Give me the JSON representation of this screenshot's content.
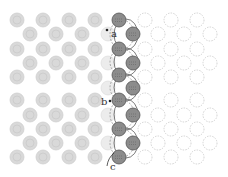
{
  "diagram": {
    "labels": {
      "a": "a",
      "b": "b",
      "c": "c"
    },
    "colors": {
      "left_atom_fill": "#d9d9d9",
      "left_atom_stroke": "#cfcfcf",
      "right_atom_stroke": "#c8c8c8",
      "chain_atom_fill": "#8c8c8c",
      "chain_atom_stroke": "#555555",
      "loop_stroke": "#444444"
    },
    "left_atoms": [
      [
        17,
        20
      ],
      [
        43,
        20
      ],
      [
        69,
        20
      ],
      [
        95,
        20
      ],
      [
        30,
        34
      ],
      [
        56,
        34
      ],
      [
        82,
        34
      ],
      [
        17,
        49
      ],
      [
        43,
        49
      ],
      [
        69,
        49
      ],
      [
        95,
        49
      ],
      [
        30,
        63
      ],
      [
        56,
        63
      ],
      [
        82,
        63
      ],
      [
        17,
        77
      ],
      [
        43,
        77
      ],
      [
        69,
        77
      ],
      [
        95,
        77
      ],
      [
        17,
        100
      ],
      [
        43,
        100
      ],
      [
        69,
        100
      ],
      [
        95,
        100
      ],
      [
        30,
        115
      ],
      [
        56,
        115
      ],
      [
        82,
        115
      ],
      [
        17,
        129
      ],
      [
        43,
        129
      ],
      [
        69,
        129
      ],
      [
        95,
        129
      ],
      [
        30,
        143
      ],
      [
        56,
        143
      ],
      [
        82,
        143
      ],
      [
        17,
        157
      ],
      [
        43,
        157
      ],
      [
        69,
        157
      ],
      [
        95,
        157
      ]
    ],
    "right_atoms": [
      [
        145,
        20
      ],
      [
        171,
        20
      ],
      [
        197,
        20
      ],
      [
        158,
        34
      ],
      [
        184,
        34
      ],
      [
        210,
        34
      ],
      [
        145,
        49
      ],
      [
        171,
        49
      ],
      [
        197,
        49
      ],
      [
        158,
        63
      ],
      [
        184,
        63
      ],
      [
        210,
        63
      ],
      [
        145,
        77
      ],
      [
        171,
        77
      ],
      [
        197,
        77
      ],
      [
        145,
        100
      ],
      [
        171,
        100
      ],
      [
        197,
        100
      ],
      [
        158,
        115
      ],
      [
        184,
        115
      ],
      [
        210,
        115
      ],
      [
        145,
        129
      ],
      [
        171,
        129
      ],
      [
        197,
        129
      ],
      [
        158,
        143
      ],
      [
        184,
        143
      ],
      [
        210,
        143
      ],
      [
        145,
        157
      ],
      [
        171,
        157
      ],
      [
        197,
        157
      ]
    ],
    "faint_atoms": [
      [
        108,
        34
      ],
      [
        108,
        63
      ],
      [
        108,
        88
      ],
      [
        108,
        115
      ],
      [
        108,
        143
      ]
    ],
    "chain_atoms": [
      [
        119,
        20
      ],
      [
        133,
        34
      ],
      [
        119,
        49
      ],
      [
        133,
        63
      ],
      [
        119,
        75
      ],
      [
        133,
        88
      ],
      [
        119,
        100
      ],
      [
        133,
        115
      ],
      [
        119,
        129
      ],
      [
        133,
        143
      ],
      [
        119,
        157
      ]
    ],
    "label_positions": {
      "a": [
        110,
        36
      ],
      "b": [
        102,
        104
      ],
      "c": [
        108,
        170
      ]
    }
  }
}
